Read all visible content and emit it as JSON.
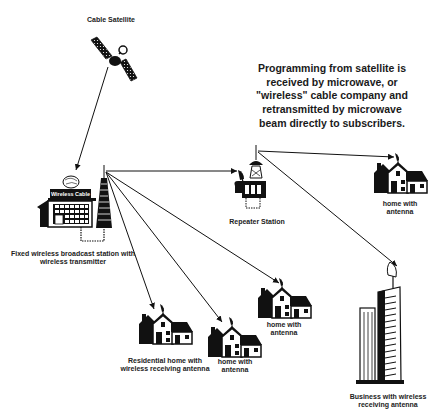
{
  "diagram": {
    "description_lines": [
      "Programming from satellite is",
      "received by microwave, or",
      "\"wireless\" cable company and",
      "retransmitted by microwave",
      "beam directly to subscribers."
    ],
    "nodes": {
      "satellite": {
        "label": "Cable Satellite"
      },
      "broadcast_station": {
        "sign": "Wireless Cable",
        "label_line1": "Fixed wireless broadcast station with",
        "label_line2": "wireless transmitter"
      },
      "repeater": {
        "label": "Repeater Station"
      },
      "home_top_right": {
        "label_line1": "home with",
        "label_line2": "antenna"
      },
      "home_middle": {
        "label_line1": "home with",
        "label_line2": "antenna"
      },
      "home_lower": {
        "label_line1": "home with",
        "label_line2": "antenna"
      },
      "home_residential": {
        "label_line1": "Residential home with",
        "label_line2": "wireless receiving antenna"
      },
      "business": {
        "label_line1": "Business with wireless",
        "label_line2": "receiving antenna"
      }
    },
    "colors": {
      "ink": "#111111",
      "background": "#ffffff",
      "window": "#ffffff"
    }
  }
}
